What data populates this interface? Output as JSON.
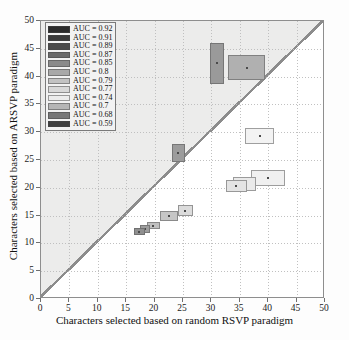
{
  "chart_data": {
    "type": "scatter",
    "title": "",
    "xlabel": "Characters selected based on random RSVP paradigm",
    "ylabel": "Characters selected based on ARSVP paradigm",
    "xlim": [
      0,
      50
    ],
    "ylim": [
      0,
      50
    ],
    "xticks": [
      0,
      5,
      10,
      15,
      20,
      25,
      30,
      35,
      40,
      45,
      50
    ],
    "yticks": [
      0,
      5,
      10,
      15,
      20,
      25,
      30,
      35,
      40,
      45,
      50
    ],
    "grid": true,
    "legend_position": "upper-left",
    "legend_title": "",
    "identity_line": true,
    "legend": [
      {
        "label": "AUC = 0.92",
        "color": "#2b2b2b"
      },
      {
        "label": "AUC = 0.91",
        "color": "#3a3a3a"
      },
      {
        "label": "AUC = 0.89",
        "color": "#4a4a4a"
      },
      {
        "label": "AUC = 0.87",
        "color": "#6a6a6a"
      },
      {
        "label": "AUC = 0.85",
        "color": "#8a8a8a"
      },
      {
        "label": "AUC = 0.8",
        "color": "#a8a8a8"
      },
      {
        "label": "AUC = 0.79",
        "color": "#c2c2c2"
      },
      {
        "label": "AUC = 0.77",
        "color": "#d8d8d8"
      },
      {
        "label": "AUC = 0.74",
        "color": "#ececec"
      },
      {
        "label": "AUC = 0.7",
        "color": "#b5b5b5"
      },
      {
        "label": "AUC = 0.68",
        "color": "#777777"
      },
      {
        "label": "AUC = 0.59",
        "color": "#3f3f3f"
      }
    ],
    "points": [
      {
        "x": 31.0,
        "y": 42.4,
        "w": 2.6,
        "h": 7.4,
        "auc": 0.92,
        "color": "#9a9a9a"
      },
      {
        "x": 36.2,
        "y": 41.6,
        "w": 6.4,
        "h": 4.6,
        "auc": 0.91,
        "color": "#b0b0b0"
      },
      {
        "x": 38.5,
        "y": 29.3,
        "w": 5.2,
        "h": 3.0,
        "auc": 0.77,
        "color": "#f3f3f3"
      },
      {
        "x": 24.2,
        "y": 26.2,
        "w": 2.3,
        "h": 3.2,
        "auc": 0.89,
        "color": "#9c9c9c"
      },
      {
        "x": 40.0,
        "y": 21.8,
        "w": 6.0,
        "h": 2.8,
        "auc": 0.79,
        "color": "#f0f0f0"
      },
      {
        "x": 35.8,
        "y": 20.7,
        "w": 4.0,
        "h": 2.6,
        "auc": 0.74,
        "color": "#eaeaea"
      },
      {
        "x": 34.4,
        "y": 20.3,
        "w": 3.6,
        "h": 2.2,
        "auc": 0.7,
        "color": "#e4e4e4"
      },
      {
        "x": 25.4,
        "y": 15.9,
        "w": 2.6,
        "h": 1.9,
        "auc": 0.8,
        "color": "#dcdcdc"
      },
      {
        "x": 22.6,
        "y": 14.9,
        "w": 3.2,
        "h": 1.7,
        "auc": 0.85,
        "color": "#c6c6c6"
      },
      {
        "x": 19.8,
        "y": 13.2,
        "w": 2.4,
        "h": 1.3,
        "auc": 0.87,
        "color": "#c0c0c0"
      },
      {
        "x": 18.3,
        "y": 12.6,
        "w": 1.8,
        "h": 1.3,
        "auc": 0.68,
        "color": "#9d9d9d"
      },
      {
        "x": 17.3,
        "y": 12.1,
        "w": 1.9,
        "h": 1.3,
        "auc": 0.59,
        "color": "#8f8f8f"
      }
    ]
  }
}
